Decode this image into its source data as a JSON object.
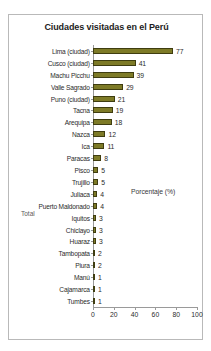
{
  "chart_data": {
    "type": "bar",
    "orientation": "horizontal",
    "title": "Ciudades visitadas en el Perú",
    "xlabel": "Porcentaje (%)",
    "ylabel": "",
    "xlim": [
      0,
      100
    ],
    "xticks": [
      "0",
      "20",
      "40",
      "60",
      "80",
      "100"
    ],
    "grid": false,
    "legend": "Total",
    "legend_position": "left-middle",
    "series_name": "Total",
    "bar_color": "#7d7a26",
    "bar_border_color": "#3f3d10",
    "categories": [
      "Lima (ciudad)",
      "Cusco (ciudad)",
      "Machu Picchu",
      "Valle Sagrado",
      "Puno (ciudad)",
      "Tacna",
      "Arequipa",
      "Nazca",
      "Ica",
      "Paracas",
      "Pisco",
      "Trujillo",
      "Juliaca",
      "Puerto Maldonado",
      "Iquitos",
      "Chiclayo",
      "Huaraz",
      "Tambopata",
      "Piura",
      "Manú",
      "Cajamarca",
      "Tumbes"
    ],
    "values": [
      77,
      41,
      39,
      29,
      21,
      19,
      18,
      12,
      11,
      8,
      5,
      5,
      4,
      4,
      3,
      3,
      3,
      2,
      2,
      1,
      1,
      1
    ],
    "value_labels": [
      "77",
      "41",
      "39",
      "29",
      "21",
      "19",
      "18",
      "12",
      "11",
      "8",
      "5",
      "5",
      "4",
      "4",
      "3",
      "3",
      "3",
      "2",
      "2",
      "1",
      "1",
      "1"
    ]
  }
}
